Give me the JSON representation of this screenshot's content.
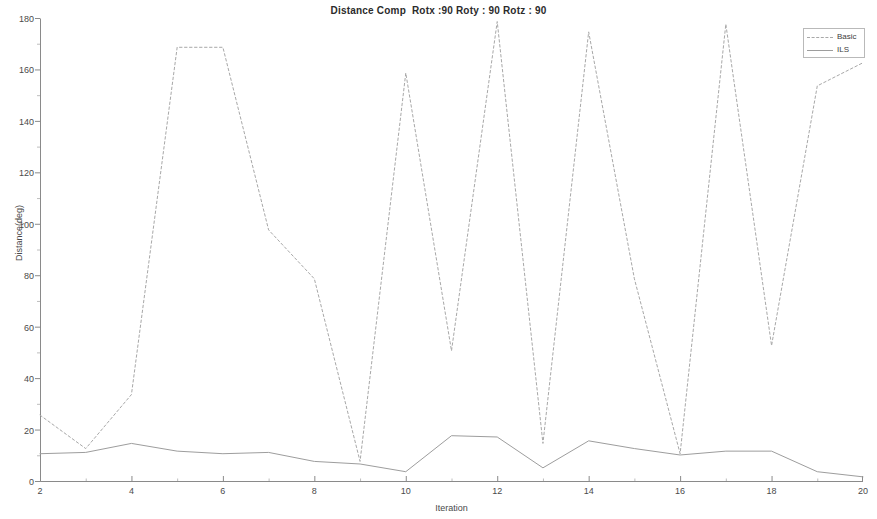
{
  "chart_data": {
    "type": "line",
    "title": "Distance Comp  Rotx :90 Roty : 90 Rotz : 90",
    "xlabel": "Iteration",
    "ylabel": "Distance(deg)",
    "xlim": [
      2,
      20
    ],
    "ylim": [
      0,
      180
    ],
    "xticks": [
      2,
      4,
      6,
      8,
      10,
      12,
      14,
      16,
      18,
      20
    ],
    "yticks": [
      0,
      20,
      40,
      60,
      80,
      100,
      120,
      140,
      160,
      180
    ],
    "grid": false,
    "legend_position": "top-right",
    "x": [
      2,
      3,
      4,
      5,
      6,
      7,
      8,
      9,
      10,
      11,
      12,
      13,
      14,
      15,
      16,
      17,
      18,
      19,
      20
    ],
    "series": [
      {
        "name": "Basic",
        "style": "dotted",
        "color": "#a8a8a8",
        "values": [
          26,
          13,
          34,
          169,
          169,
          98,
          79,
          8,
          159,
          51,
          179,
          15,
          175,
          79,
          11,
          178,
          53,
          154,
          163
        ]
      },
      {
        "name": "ILS",
        "style": "solid",
        "color": "#9d9d9d",
        "values": [
          11,
          11.5,
          15,
          12,
          11,
          11.5,
          8,
          7,
          4,
          18,
          17.5,
          5.5,
          16,
          13,
          10.5,
          12,
          12,
          4,
          2
        ]
      }
    ]
  },
  "legend": {
    "entries": [
      {
        "label": "Basic"
      },
      {
        "label": "ILS"
      }
    ]
  },
  "colors": {
    "axis": "#8a8a8a",
    "text": "#4a4a4a",
    "background": "#ffffff"
  }
}
